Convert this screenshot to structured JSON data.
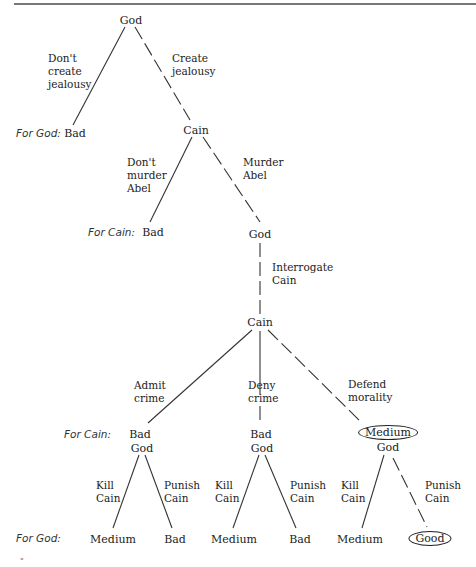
{
  "diagram": {
    "type": "game-tree",
    "nodes": {
      "root": {
        "label": "God"
      },
      "cain1": {
        "label": "Cain"
      },
      "god2": {
        "label": "God"
      },
      "cain2": {
        "label": "Cain"
      },
      "god_admit": {
        "label": "God"
      },
      "god_deny": {
        "label": "God"
      },
      "god_defend": {
        "label": "God"
      }
    },
    "actions": {
      "dont_create": "Don't create jealousy",
      "create": "Create jealousy",
      "dont_murder": "Don't murder Abel",
      "murder": "Murder Abel",
      "interrogate": "Interrogate Cain",
      "admit": "Admit crime",
      "deny": "Deny crime",
      "defend": "Defend morality",
      "kill": "Kill Cain",
      "punish": "Punish Cain"
    },
    "action_lines": {
      "dont_create": [
        "Don't",
        "create",
        "jealousy"
      ],
      "create": [
        "Create",
        "jealousy"
      ],
      "dont_murder": [
        "Don't",
        "murder",
        "Abel"
      ],
      "murder": [
        "Murder",
        "Abel"
      ],
      "interrogate": [
        "Interrogate",
        "Cain"
      ],
      "admit": [
        "Admit",
        "crime"
      ],
      "deny": [
        "Deny",
        "crime"
      ],
      "defend": [
        "Defend",
        "morality"
      ],
      "kill": [
        "Kill",
        "Cain"
      ],
      "punish": [
        "Punish",
        "Cain"
      ]
    },
    "payoff_labels": {
      "for_god": "For God:",
      "for_cain": "For Cain:"
    },
    "payoffs": {
      "no_jealousy_god": "Bad",
      "no_murder_cain": "Bad",
      "admit_cain": "Bad",
      "deny_cain": "Bad",
      "defend_cain": "Medium",
      "admit_kill_god": "Medium",
      "admit_punish_god": "Bad",
      "deny_kill_god": "Medium",
      "deny_punish_god": "Bad",
      "defend_kill_god": "Medium",
      "defend_punish_god": "Good"
    },
    "equilibrium_path": [
      "Create jealousy",
      "Murder Abel",
      "Interrogate Cain",
      "Defend morality",
      "Punish Cain"
    ],
    "circled_outcomes": [
      "Medium",
      "Good"
    ]
  },
  "footnote_mark": "\""
}
